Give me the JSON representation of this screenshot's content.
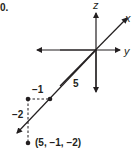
{
  "problem": {
    "part_label": "0."
  },
  "axes": {
    "x_label": "x",
    "y_label": "y",
    "z_label": "z"
  },
  "annotations": {
    "x_distance": "5",
    "y_offset": "−1",
    "z_offset": "−2"
  },
  "point": {
    "label": "(5, −1, −2)",
    "x": 5,
    "y": -1,
    "z": -2
  },
  "colors": {
    "ink": "#231f20",
    "background": "#ffffff"
  }
}
